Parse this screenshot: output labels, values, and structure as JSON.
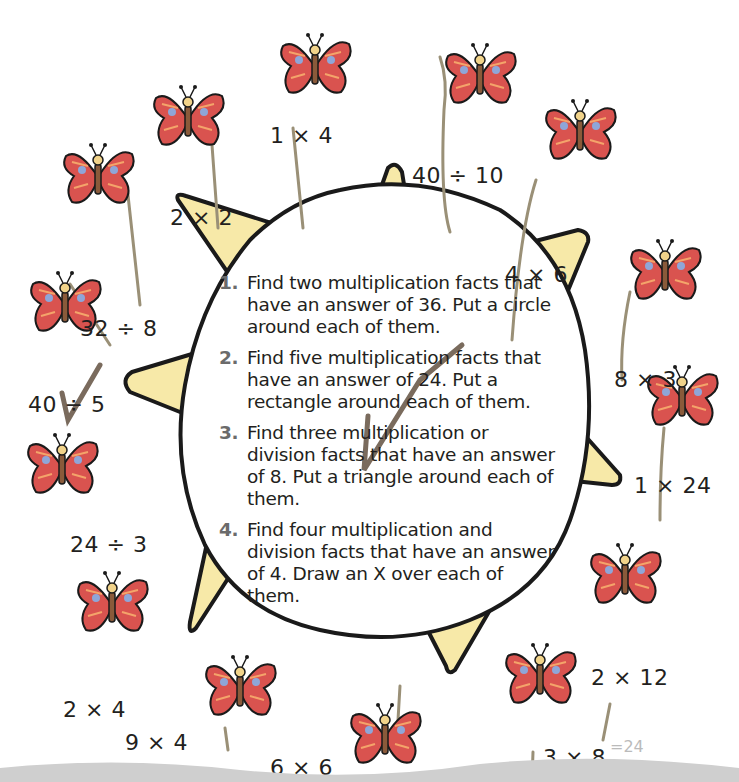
{
  "instructions": [
    {
      "num": "1.",
      "text": "Find two multiplication facts that have an answer of 36. Put a circle around each of them."
    },
    {
      "num": "2.",
      "text": "Find five multiplication facts that have an answer of 24. Put a rectangle around each of them."
    },
    {
      "num": "3.",
      "text": "Find three multiplication or division facts that have an answer of 8. Put a triangle around each of them."
    },
    {
      "num": "4.",
      "text": "Find four multiplication and division facts that have an answer of 4. Draw an X over each of them."
    }
  ],
  "facts": [
    {
      "label": "1 × 4",
      "x": 270,
      "y": 123
    },
    {
      "label": "40 ÷ 10",
      "x": 412,
      "y": 163
    },
    {
      "label": "2 × 2",
      "x": 170,
      "y": 205
    },
    {
      "label": "4 × 6",
      "x": 505,
      "y": 262
    },
    {
      "label": "32 ÷ 8",
      "x": 80,
      "y": 316
    },
    {
      "label": "8 × 3",
      "x": 614,
      "y": 367
    },
    {
      "label": "40 ÷ 5",
      "x": 28,
      "y": 392
    },
    {
      "label": "24 ÷ 3",
      "x": 70,
      "y": 532
    },
    {
      "label": "1 × 24",
      "x": 634,
      "y": 473
    },
    {
      "label": "2 × 12",
      "x": 591,
      "y": 665
    },
    {
      "label": "2 × 4",
      "x": 63,
      "y": 697
    },
    {
      "label": "9 × 4",
      "x": 125,
      "y": 730
    },
    {
      "label": "6 × 6",
      "x": 270,
      "y": 755
    },
    {
      "label": "3 × 8",
      "x": 543,
      "y": 745
    }
  ],
  "handwritten_annotation": "=24",
  "colors": {
    "butterfly_wing": "#d9534f",
    "butterfly_spot": "#8fa6d8",
    "butterfly_stripe": "#f4a46a",
    "sun_fill": "#ffffff",
    "sun_ray": "#f7e9a8",
    "outline": "#1a1a1a",
    "pencil": "#7a6b5d",
    "stem": "#9a9077"
  }
}
